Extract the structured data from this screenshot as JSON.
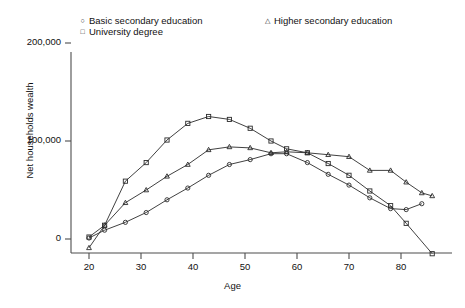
{
  "figure": {
    "cut_off_title": "",
    "cut_off_footnote": ""
  },
  "legend": {
    "position": "top",
    "entries": [
      {
        "label": "Basic secondary education",
        "marker": "circle",
        "marker_glyph": "○",
        "column": 1
      },
      {
        "label": "University degree",
        "marker": "square",
        "marker_glyph": "□",
        "column": 1
      },
      {
        "label": "Higher secondary education",
        "marker": "triangle",
        "marker_glyph": "△",
        "column": 2
      }
    ]
  },
  "axes": {
    "y_title": "Net households wealth",
    "x_title": "Age",
    "y_ticks": [
      "0",
      "100,000",
      "200,000"
    ],
    "x_ticks": [
      "20",
      "30",
      "40",
      "50",
      "60",
      "70",
      "80"
    ]
  },
  "chart_data": {
    "type": "line",
    "title": "",
    "xlabel": "Age",
    "ylabel": "Net households wealth",
    "xlim": [
      19,
      87
    ],
    "ylim": [
      -20000,
      210000
    ],
    "ytick_values": [
      0,
      100000,
      200000
    ],
    "xtick_values": [
      20,
      30,
      40,
      50,
      60,
      70,
      80
    ],
    "grid": false,
    "legend_position": "top",
    "series": [
      {
        "name": "Basic secondary education",
        "marker": "circle",
        "points": [
          [
            20,
            1000
          ],
          [
            23,
            9000
          ],
          [
            27,
            17000
          ],
          [
            31,
            27000
          ],
          [
            35,
            40000
          ],
          [
            39,
            52000
          ],
          [
            43,
            65000
          ],
          [
            47,
            76000
          ],
          [
            51,
            81000
          ],
          [
            55,
            87000
          ],
          [
            58,
            87000
          ],
          [
            62,
            78000
          ],
          [
            66,
            66000
          ],
          [
            70,
            55000
          ],
          [
            74,
            42000
          ],
          [
            78,
            31000
          ],
          [
            81,
            30000
          ],
          [
            84,
            36000
          ]
        ]
      },
      {
        "name": "University degree",
        "marker": "square",
        "points": [
          [
            20,
            2000
          ],
          [
            23,
            14000
          ],
          [
            27,
            59000
          ],
          [
            31,
            78000
          ],
          [
            35,
            101000
          ],
          [
            39,
            118000
          ],
          [
            43,
            125000
          ],
          [
            47,
            122000
          ],
          [
            51,
            113000
          ],
          [
            55,
            100000
          ],
          [
            58,
            92000
          ],
          [
            62,
            88000
          ],
          [
            66,
            77000
          ],
          [
            70,
            65000
          ],
          [
            74,
            49000
          ],
          [
            78,
            34000
          ],
          [
            81,
            16000
          ],
          [
            86,
            -15000
          ]
        ]
      },
      {
        "name": "Higher secondary education",
        "marker": "triangle",
        "points": [
          [
            20,
            -9000
          ],
          [
            23,
            14000
          ],
          [
            27,
            37000
          ],
          [
            31,
            50000
          ],
          [
            35,
            64000
          ],
          [
            39,
            76000
          ],
          [
            43,
            91000
          ],
          [
            47,
            94000
          ],
          [
            51,
            93000
          ],
          [
            55,
            88000
          ],
          [
            58,
            89000
          ],
          [
            62,
            88000
          ],
          [
            66,
            86000
          ],
          [
            70,
            84000
          ],
          [
            74,
            70000
          ],
          [
            78,
            70000
          ],
          [
            81,
            58000
          ],
          [
            84,
            47000
          ],
          [
            86,
            44000
          ]
        ]
      }
    ]
  }
}
